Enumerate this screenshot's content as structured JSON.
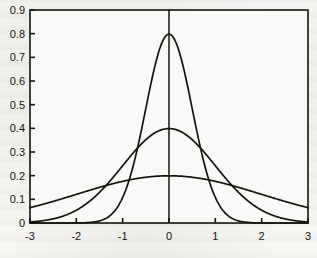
{
  "chart_data": {
    "type": "line",
    "title": "",
    "subtitle": "",
    "xlabel": "",
    "ylabel": "",
    "xlim": [
      -3,
      3
    ],
    "ylim": [
      0,
      0.9
    ],
    "grid": false,
    "legend": "none",
    "x_ticks": [
      -3,
      -2,
      -1,
      0,
      1,
      2,
      3
    ],
    "x_tick_labels": [
      "-3",
      "-2",
      "-1",
      "0",
      "1",
      "2",
      "3"
    ],
    "y_ticks": [
      0,
      0.1,
      0.2,
      0.3,
      0.4,
      0.5,
      0.6,
      0.7,
      0.8,
      0.9
    ],
    "y_tick_labels": [
      "0",
      "0.1",
      "0.2",
      "0.3",
      "0.4",
      "0.5",
      "0.6",
      "0.7",
      "0.8",
      "0.9"
    ],
    "annotations": [
      {
        "name": "vertical-axis-line-at-zero",
        "x": 0,
        "y_from": 0,
        "y_to": 0.9
      }
    ],
    "series": [
      {
        "name": "gaussian-sigma-0.5",
        "mu": 0,
        "sigma": 0.5,
        "peak": 0.798,
        "color": "#141310",
        "x": [
          -3,
          -2.75,
          -2.5,
          -2.25,
          -2,
          -1.75,
          -1.5,
          -1.25,
          -1,
          -0.75,
          -0.5,
          -0.25,
          0,
          0.25,
          0.5,
          0.75,
          1,
          1.25,
          1.5,
          1.75,
          2,
          2.25,
          2.5,
          2.75,
          3
        ],
        "values": [
          0.0,
          0.0,
          0.0002,
          0.0011,
          0.0053,
          0.0211,
          0.0707,
          0.1994,
          0.4839,
          0.7041,
          0.7041,
          0.4839,
          0.7979,
          0.4839,
          0.4839,
          0.7041,
          0.4839,
          0.1994,
          0.0707,
          0.0211,
          0.0053,
          0.0011,
          0.0002,
          0.0,
          0.0
        ]
      },
      {
        "name": "gaussian-sigma-1",
        "mu": 0,
        "sigma": 1,
        "peak": 0.399,
        "color": "#141310",
        "x": [
          -3,
          -2.5,
          -2,
          -1.5,
          -1,
          -0.5,
          0,
          0.5,
          1,
          1.5,
          2,
          2.5,
          3
        ],
        "values": [
          0.0044,
          0.0175,
          0.054,
          0.1295,
          0.242,
          0.3521,
          0.3989,
          0.3521,
          0.242,
          0.1295,
          0.054,
          0.0175,
          0.0044
        ]
      },
      {
        "name": "gaussian-sigma-2",
        "mu": 0,
        "sigma": 2,
        "peak": 0.199,
        "color": "#141310",
        "x": [
          -3,
          -2.5,
          -2,
          -1.5,
          -1,
          -0.5,
          0,
          0.5,
          1,
          1.5,
          2,
          2.5,
          3
        ],
        "values": [
          0.0648,
          0.0913,
          0.121,
          0.1506,
          0.176,
          0.1933,
          0.1995,
          0.1933,
          0.176,
          0.1506,
          0.121,
          0.0913,
          0.0648
        ]
      }
    ]
  },
  "style": {
    "axis_color": "#141310",
    "curve_color": "#141310",
    "background_color": "#f7f6f4",
    "plot_background_color": "#faf9f7",
    "tick_label_color": "#15140f"
  }
}
